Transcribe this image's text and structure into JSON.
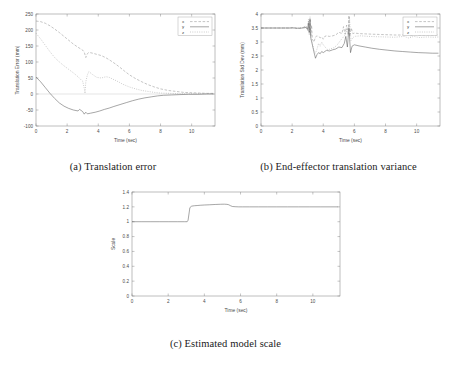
{
  "figure": {
    "panels": [
      {
        "id": "a",
        "caption": "(a) Translation error"
      },
      {
        "id": "b",
        "caption": "(b) End-effector translation variance"
      },
      {
        "id": "c",
        "caption": "(c) Estimated model scale"
      }
    ]
  },
  "chart_data": [
    {
      "panel": "a",
      "type": "line",
      "title": "",
      "xlabel": "Time (sec)",
      "ylabel": "Translation Error (mm)",
      "xlim": [
        0,
        11.5
      ],
      "ylim": [
        -100,
        250
      ],
      "xticks": [
        0,
        2,
        4,
        6,
        8,
        10
      ],
      "xtick_labels": [
        "0",
        "2",
        "4",
        "6",
        "8",
        "10"
      ],
      "yticks": [
        -100,
        -50,
        0,
        50,
        100,
        150,
        200,
        250
      ],
      "ytick_labels": [
        "-100",
        "-50",
        "0",
        "50",
        "100",
        "150",
        "200",
        "250"
      ],
      "grid": false,
      "legend_position": "top-right",
      "legend": [
        "x",
        "y",
        "z"
      ],
      "series": [
        {
          "name": "x",
          "style": "dashed",
          "color": "#8a8a8a",
          "x": [
            0,
            0.3,
            0.6,
            0.9,
            1.2,
            1.5,
            1.8,
            2.1,
            2.4,
            2.7,
            3.0,
            3.1,
            3.2,
            3.3,
            3.4,
            3.6,
            3.9,
            4.2,
            4.5,
            4.8,
            5.1,
            5.4,
            5.7,
            6.0,
            6.4,
            6.8,
            7.2,
            7.6,
            8.0,
            8.5,
            9.0,
            9.5,
            10.0,
            10.5,
            11.0,
            11.4
          ],
          "y": [
            228,
            226,
            221,
            213,
            203,
            192,
            180,
            168,
            156,
            146,
            137,
            131,
            114,
            126,
            130,
            128,
            124,
            120,
            113,
            104,
            94,
            83,
            71,
            60,
            48,
            38,
            29,
            22,
            16,
            11,
            8,
            5,
            4,
            3,
            2,
            2
          ]
        },
        {
          "name": "y",
          "style": "solid",
          "color": "#4f4f4f",
          "x": [
            0,
            0.3,
            0.6,
            0.9,
            1.2,
            1.5,
            1.8,
            2.1,
            2.4,
            2.7,
            2.8,
            3.0,
            3.1,
            3.2,
            3.3,
            3.5,
            3.8,
            4.1,
            4.4,
            4.7,
            5.0,
            5.4,
            5.8,
            6.2,
            6.6,
            7.0,
            7.4,
            7.8,
            8.2,
            8.7,
            9.2,
            9.8,
            10.4,
            11.0,
            11.4
          ],
          "y": [
            53,
            38,
            20,
            2,
            -14,
            -28,
            -38,
            -45,
            -50,
            -53,
            -48,
            -55,
            -63,
            -57,
            -62,
            -60,
            -57,
            -53,
            -48,
            -44,
            -39,
            -33,
            -27,
            -21,
            -16,
            -12,
            -9,
            -6,
            -4,
            -3,
            -2,
            -1,
            -1,
            0,
            0
          ]
        },
        {
          "name": "z",
          "style": "dotted",
          "color": "#9a9a9a",
          "x": [
            0,
            0.3,
            0.6,
            0.9,
            1.2,
            1.5,
            1.8,
            2.1,
            2.4,
            2.7,
            2.9,
            3.0,
            3.1,
            3.15,
            3.2,
            3.3,
            3.4,
            3.6,
            3.9,
            4.2,
            4.5,
            4.7,
            5.0,
            5.3,
            5.6,
            6.0,
            6.4,
            6.8,
            7.2,
            7.6,
            8.0,
            8.6,
            9.2,
            9.8,
            10.4,
            11.0,
            11.4
          ],
          "y": [
            190,
            172,
            152,
            132,
            114,
            100,
            88,
            77,
            66,
            54,
            44,
            40,
            18,
            2,
            38,
            60,
            70,
            62,
            52,
            50,
            54,
            52,
            45,
            38,
            30,
            22,
            16,
            11,
            8,
            5,
            3,
            2,
            1,
            1,
            1,
            1,
            1
          ]
        }
      ]
    },
    {
      "panel": "b",
      "type": "line",
      "title": "",
      "xlabel": "Time (sec)",
      "ylabel": "Translation Std Dev (mm)",
      "xlim": [
        0,
        11.5
      ],
      "ylim": [
        0,
        4
      ],
      "xticks": [
        0,
        2,
        4,
        6,
        8,
        10
      ],
      "xtick_labels": [
        "0",
        "2",
        "4",
        "6",
        "8",
        "10"
      ],
      "yticks": [
        0,
        0.5,
        1,
        1.5,
        2,
        2.5,
        3,
        3.5,
        4
      ],
      "ytick_labels": [
        "0",
        "0.5",
        "1",
        "1.5",
        "2",
        "2.5",
        "3",
        "3.5",
        "4"
      ],
      "grid": false,
      "legend_position": "top-right",
      "legend": [
        "x",
        "y",
        "z"
      ],
      "series": [
        {
          "name": "x",
          "style": "dashed",
          "color": "#8a8a8a",
          "x": [
            0,
            1.0,
            1.8,
            2.1,
            2.3,
            2.6,
            2.9,
            3.0,
            3.05,
            3.1,
            3.15,
            3.2,
            3.25,
            3.3,
            3.4,
            3.5,
            3.6,
            3.7,
            3.8,
            3.9,
            4.0,
            4.1,
            4.2,
            4.4,
            4.6,
            4.8,
            5.0,
            5.2,
            5.3,
            5.4,
            5.5,
            5.6,
            5.65,
            5.7,
            5.8,
            5.9,
            6.0,
            6.3,
            6.7,
            7.1,
            7.6,
            8.1,
            8.6,
            9.1,
            9.4,
            9.6,
            9.9,
            10.2,
            10.6,
            11.0,
            11.4
          ],
          "y": [
            3.5,
            3.5,
            3.5,
            3.52,
            3.48,
            3.5,
            3.55,
            3.42,
            3.75,
            3.3,
            3.85,
            3.2,
            3.6,
            3.1,
            3.0,
            3.18,
            3.22,
            3.2,
            3.15,
            3.18,
            3.1,
            3.2,
            3.22,
            3.2,
            3.22,
            3.25,
            3.35,
            3.3,
            3.55,
            3.28,
            3.6,
            3.3,
            3.95,
            3.2,
            3.5,
            3.3,
            3.32,
            3.3,
            3.29,
            3.28,
            3.27,
            3.26,
            3.25,
            3.25,
            3.28,
            3.22,
            3.26,
            3.23,
            3.25,
            3.24,
            3.25
          ]
        },
        {
          "name": "y",
          "style": "solid",
          "color": "#4f4f4f",
          "x": [
            0,
            1.0,
            1.8,
            2.1,
            2.4,
            2.7,
            2.9,
            3.0,
            3.05,
            3.1,
            3.15,
            3.2,
            3.3,
            3.4,
            3.5,
            3.6,
            3.7,
            3.8,
            3.9,
            4.0,
            4.2,
            4.4,
            4.6,
            4.8,
            5.0,
            5.2,
            5.35,
            5.45,
            5.55,
            5.65,
            5.75,
            5.85,
            6.0,
            6.3,
            6.7,
            7.1,
            7.6,
            8.1,
            8.6,
            9.1,
            9.6,
            10.1,
            10.6,
            11.0,
            11.4
          ],
          "y": [
            3.5,
            3.5,
            3.5,
            3.5,
            3.49,
            3.5,
            3.52,
            3.45,
            3.68,
            3.35,
            3.8,
            3.15,
            2.9,
            2.65,
            2.42,
            2.55,
            2.62,
            2.58,
            2.66,
            2.62,
            2.7,
            2.68,
            2.72,
            2.75,
            2.82,
            2.8,
            2.95,
            3.2,
            2.82,
            3.5,
            2.62,
            2.85,
            2.9,
            2.86,
            2.82,
            2.78,
            2.74,
            2.71,
            2.68,
            2.66,
            2.64,
            2.62,
            2.61,
            2.6,
            2.6
          ]
        },
        {
          "name": "z",
          "style": "dotted",
          "color": "#9a9a9a",
          "x": [
            0,
            1.0,
            1.8,
            2.2,
            2.6,
            2.9,
            3.0,
            3.05,
            3.1,
            3.15,
            3.2,
            3.3,
            3.4,
            3.5,
            3.6,
            3.7,
            3.8,
            3.9,
            4.0,
            4.15,
            4.3,
            4.5,
            4.7,
            4.9,
            5.1,
            5.25,
            5.4,
            5.5,
            5.6,
            5.68,
            5.78,
            5.9,
            6.0,
            6.4,
            6.9,
            7.4,
            8.0,
            8.6,
            9.2,
            9.5,
            9.8,
            10.2,
            10.7,
            11.1,
            11.4
          ],
          "y": [
            3.5,
            3.5,
            3.5,
            3.51,
            3.5,
            3.58,
            3.4,
            3.82,
            3.25,
            3.9,
            3.1,
            2.95,
            2.7,
            2.6,
            2.75,
            2.95,
            2.85,
            3.0,
            2.9,
            2.8,
            2.72,
            2.76,
            2.8,
            2.9,
            3.05,
            3.15,
            3.25,
            3.45,
            3.2,
            3.9,
            3.05,
            3.15,
            3.2,
            3.22,
            3.2,
            3.19,
            3.18,
            3.17,
            3.2,
            3.14,
            3.2,
            3.16,
            3.18,
            3.17,
            3.18
          ]
        }
      ]
    },
    {
      "panel": "c",
      "type": "line",
      "title": "",
      "xlabel": "Time (sec)",
      "ylabel": "Scale",
      "xlim": [
        0,
        11.5
      ],
      "ylim": [
        0,
        1.4
      ],
      "xticks": [
        0,
        2,
        4,
        6,
        8,
        10
      ],
      "xtick_labels": [
        "0",
        "2",
        "4",
        "6",
        "8",
        "10"
      ],
      "yticks": [
        0,
        0.2,
        0.4,
        0.6,
        0.8,
        1,
        1.2,
        1.4
      ],
      "ytick_labels": [
        "0",
        "0.2",
        "0.4",
        "0.6",
        "0.8",
        "1",
        "1.2",
        "1.4"
      ],
      "grid": false,
      "legend_position": "none",
      "legend": [],
      "series": [
        {
          "name": "scale",
          "style": "solid",
          "color": "#4f4f4f",
          "x": [
            0,
            0.5,
            1.0,
            1.5,
            2.0,
            2.5,
            2.9,
            3.05,
            3.1,
            3.2,
            3.3,
            3.45,
            3.6,
            3.8,
            4.0,
            4.3,
            4.6,
            4.9,
            5.1,
            5.25,
            5.35,
            5.45,
            5.55,
            5.7,
            5.9,
            6.1,
            6.5,
            7.0,
            7.5,
            8.0,
            8.6,
            9.2,
            9.8,
            10.4,
            11.0,
            11.4
          ],
          "y": [
            1.0,
            1.0,
            1.0,
            1.0,
            1.0,
            1.0,
            1.0,
            1.0,
            1.02,
            1.19,
            1.21,
            1.215,
            1.218,
            1.222,
            1.225,
            1.228,
            1.232,
            1.235,
            1.236,
            1.234,
            1.228,
            1.215,
            1.205,
            1.202,
            1.2,
            1.2,
            1.2,
            1.2,
            1.2,
            1.2,
            1.2,
            1.2,
            1.2,
            1.2,
            1.2,
            1.2
          ]
        }
      ]
    }
  ]
}
